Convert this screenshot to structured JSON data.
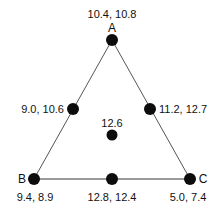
{
  "diagram": {
    "type": "triangle-node-graph",
    "canvas": {
      "width": 222,
      "height": 209
    },
    "style": {
      "dot_color": "#0d0d0d",
      "edge_color_slanted": "#555555",
      "edge_color_base": "#9a9a9a",
      "text_color": "#111111",
      "background": "#ffffff"
    },
    "vertices": [
      {
        "id": "A",
        "name": "apex",
        "label": "A",
        "value": "10.4, 10.8",
        "x": 112,
        "y": 40,
        "r": 6
      },
      {
        "id": "B",
        "name": "bottom-left",
        "label": "B",
        "value": "9.4, 8.9",
        "x": 34,
        "y": 179,
        "r": 6
      },
      {
        "id": "C",
        "name": "bottom-right",
        "label": "C",
        "value": "5.0, 7.4",
        "x": 190,
        "y": 179,
        "r": 6
      }
    ],
    "midpoints": [
      {
        "id": "AB",
        "name": "left-edge-midpoint",
        "value": "9.0, 10.6",
        "x": 73,
        "y": 109,
        "r": 6
      },
      {
        "id": "AC",
        "name": "right-edge-midpoint",
        "value": "11.2, 12.7",
        "x": 150,
        "y": 109,
        "r": 6
      },
      {
        "id": "BC",
        "name": "bottom-edge-midpoint",
        "value": "12.8, 12.4",
        "x": 112,
        "y": 179,
        "r": 6
      }
    ],
    "center": {
      "id": "center",
      "name": "centroid",
      "value": "12.6",
      "x": 112,
      "y": 135,
      "r": 5
    },
    "edges": [
      {
        "id": "AB",
        "from": "A",
        "to": "B",
        "color": "#555555",
        "width": 1
      },
      {
        "id": "AC",
        "from": "A",
        "to": "C",
        "color": "#555555",
        "width": 1
      },
      {
        "id": "BC",
        "from": "B",
        "to": "C",
        "color": "#9a9a9a",
        "width": 2
      }
    ]
  },
  "labels": {
    "apex_value": "10.4, 10.8",
    "apex_vertex": "A",
    "left_mid_value": "9.0, 10.6",
    "right_mid_value": "11.2, 12.7",
    "center_value": "12.6",
    "b_vertex": "B",
    "b_value": "9.4, 8.9",
    "bottom_mid_value": "12.8, 12.4",
    "c_vertex": "C",
    "c_value": "5.0, 7.4"
  }
}
